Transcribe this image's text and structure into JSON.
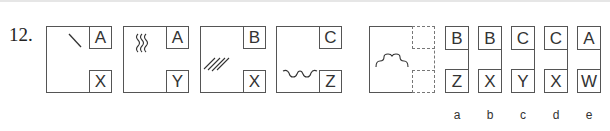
{
  "question": {
    "number": "12.",
    "panels": [
      {
        "glyph": "single-slash",
        "top_label": "A",
        "bottom_label": "X"
      },
      {
        "glyph": "three-wavy-lines",
        "top_label": "A",
        "bottom_label": "Y"
      },
      {
        "glyph": "four-diagonal-lines",
        "top_label": "B",
        "bottom_label": "X"
      },
      {
        "glyph": "wavy-step-curve-bottom",
        "top_label": "C",
        "bottom_label": "Z"
      },
      {
        "glyph": "bump-curve",
        "top_label": "",
        "bottom_label": "",
        "missing": true
      }
    ]
  },
  "options": [
    {
      "letter": "a",
      "top": "B",
      "bottom": "Z"
    },
    {
      "letter": "b",
      "top": "B",
      "bottom": "X"
    },
    {
      "letter": "c",
      "top": "C",
      "bottom": "Y"
    },
    {
      "letter": "d",
      "top": "C",
      "bottom": "X"
    },
    {
      "letter": "e",
      "top": "A",
      "bottom": "W"
    }
  ],
  "colors": {
    "line": "#555555",
    "text": "#333333"
  }
}
